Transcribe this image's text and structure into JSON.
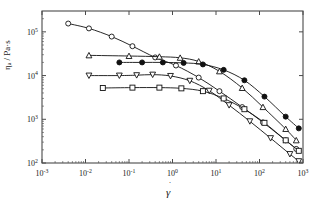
{
  "chart_data": {
    "type": "line",
    "title": "",
    "subtitle": "",
    "xlabel": "γ̇",
    "ylabel": "η / Pa·s",
    "ylabel_parts": {
      "symbol": "η",
      "subscript": "a",
      "unit": "/ Pa·s"
    },
    "xscale": "log",
    "yscale": "log",
    "xlim": [
      0.001,
      1000
    ],
    "ylim": [
      100,
      300000
    ],
    "xticks": [
      0.001,
      0.01,
      0.1,
      1,
      10,
      100,
      1000
    ],
    "xticklabels": [
      "10⁻³",
      "10⁻²",
      "10⁻¹",
      "10⁰",
      "10¹",
      "10²",
      "10³"
    ],
    "xtick_exponents": [
      "-3",
      "-2",
      "-1",
      "0",
      "1",
      "2",
      "3"
    ],
    "yticks": [
      100,
      1000,
      10000,
      100000
    ],
    "yticklabels": [
      "10²",
      "10³",
      "10⁴",
      "10⁵"
    ],
    "ytick_exponents": [
      "2",
      "3",
      "4",
      "5"
    ],
    "grid": false,
    "legend": "none",
    "frame": "box",
    "series": [
      {
        "name": "series-open-circle",
        "marker": "open-circle",
        "filled": false,
        "color": "#111111",
        "x": [
          0.004,
          0.012,
          0.04,
          0.12,
          0.4,
          1.2,
          4,
          12,
          40,
          120,
          400,
          700
        ],
        "y": [
          155000,
          120000,
          78000,
          47000,
          26000,
          17000,
          9000,
          4400,
          1900,
          850,
          330,
          210
        ]
      },
      {
        "name": "series-open-triangle-up",
        "marker": "open-triangle-up",
        "filled": false,
        "color": "#111111",
        "x": [
          0.012,
          0.1,
          0.5,
          1.5,
          4,
          12,
          40,
          120,
          400,
          700
        ],
        "y": [
          29000,
          28000,
          27000,
          25500,
          21000,
          12500,
          5200,
          1900,
          600,
          330
        ]
      },
      {
        "name": "series-filled-circle",
        "marker": "filled-circle",
        "filled": true,
        "color": "#111111",
        "x": [
          0.06,
          0.2,
          0.6,
          1.8,
          5,
          15,
          45,
          130,
          400,
          800
        ],
        "y": [
          20000,
          20000,
          20000,
          19500,
          18000,
          13500,
          7800,
          3300,
          1150,
          620
        ]
      },
      {
        "name": "series-open-triangle-down",
        "marker": "open-triangle-down",
        "filled": false,
        "color": "#111111",
        "x": [
          0.012,
          0.06,
          0.15,
          0.35,
          0.9,
          2.5,
          7,
          20,
          60,
          180,
          500,
          800
        ],
        "y": [
          10000,
          10000,
          10200,
          10500,
          9800,
          7600,
          4500,
          2100,
          900,
          370,
          160,
          110
        ]
      },
      {
        "name": "series-open-square",
        "marker": "open-square",
        "filled": false,
        "color": "#111111",
        "x": [
          0.025,
          0.12,
          0.5,
          1.6,
          5,
          15,
          45,
          130,
          400,
          800
        ],
        "y": [
          5200,
          5300,
          5300,
          5100,
          4400,
          3000,
          1700,
          830,
          330,
          190
        ]
      }
    ]
  },
  "figure": {
    "background": "#ffffff",
    "axis_color": "#4a4a4a",
    "data_color": "#111111"
  }
}
